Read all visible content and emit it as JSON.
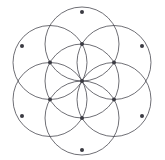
{
  "figure": {
    "background_color": "#ffffff"
  },
  "chart_data": {
    "type": "diagram",
    "subtype": "sacred-geometry-seed-of-life",
    "canvas": {
      "width": 165,
      "height": 160
    },
    "center": {
      "x": 82,
      "y": 81
    },
    "circle_radius": 37,
    "style": {
      "stroke_color": "#4a4a52",
      "stroke_width": 0.8,
      "dot_color": "#3a3a42",
      "dot_radius": 2.0,
      "background": "#ffffff",
      "grid": false,
      "legend": false,
      "axes": false
    },
    "circles": [
      {
        "name": "center-circle",
        "cx": 82,
        "cy": 81,
        "r": 37
      },
      {
        "name": "circle-top",
        "cx": 82,
        "cy": 44,
        "r": 37
      },
      {
        "name": "circle-upper-right",
        "cx": 114,
        "cy": 62.5,
        "r": 37
      },
      {
        "name": "circle-lower-right",
        "cx": 114,
        "cy": 99.5,
        "r": 37
      },
      {
        "name": "circle-bottom",
        "cx": 82,
        "cy": 118,
        "r": 37
      },
      {
        "name": "circle-lower-left",
        "cx": 50,
        "cy": 99.5,
        "r": 37
      },
      {
        "name": "circle-upper-left",
        "cx": 50,
        "cy": 62.5,
        "r": 37
      }
    ],
    "vertices": [
      {
        "name": "vertex-center",
        "x": 82,
        "y": 81
      },
      {
        "name": "vertex-inner-top",
        "x": 82,
        "y": 44
      },
      {
        "name": "vertex-inner-upper-right",
        "x": 114,
        "y": 62.5
      },
      {
        "name": "vertex-inner-lower-right",
        "x": 114,
        "y": 99.5
      },
      {
        "name": "vertex-inner-bottom",
        "x": 82,
        "y": 118
      },
      {
        "name": "vertex-inner-lower-left",
        "x": 50,
        "y": 99.5
      },
      {
        "name": "vertex-inner-upper-left",
        "x": 50,
        "y": 62.5
      },
      {
        "name": "vertex-outer-top",
        "x": 82,
        "y": 12
      },
      {
        "name": "vertex-outer-upper-right",
        "x": 142,
        "y": 46
      },
      {
        "name": "vertex-outer-lower-right",
        "x": 142,
        "y": 116
      },
      {
        "name": "vertex-outer-bottom",
        "x": 82,
        "y": 150
      },
      {
        "name": "vertex-outer-lower-left",
        "x": 22,
        "y": 116
      },
      {
        "name": "vertex-outer-upper-left",
        "x": 22,
        "y": 46
      }
    ],
    "counts": {
      "circles": 7,
      "marked_points": 13,
      "inner_hexagon_points": 6,
      "outer_hexagon_points": 6
    }
  }
}
